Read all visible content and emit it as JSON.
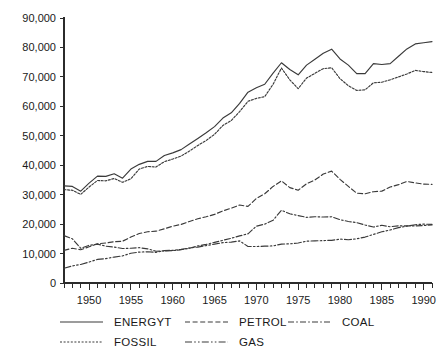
{
  "chart_data": {
    "type": "line",
    "title": "",
    "subtitle": "",
    "xlabel": "",
    "ylabel": "",
    "xlim": [
      1947,
      1991
    ],
    "ylim": [
      0,
      90000
    ],
    "grid": false,
    "legend_position": "bottom",
    "y_ticks": [
      0,
      10000,
      20000,
      30000,
      40000,
      50000,
      60000,
      70000,
      80000,
      90000
    ],
    "y_tick_labels": [
      "0",
      "10,000",
      "20,000",
      "30,000",
      "40,000",
      "50,000",
      "60,000",
      "70,000",
      "80,000",
      "90,000"
    ],
    "x_ticks": [
      1950,
      1955,
      1960,
      1965,
      1970,
      1975,
      1980,
      1985,
      1990
    ],
    "x_tick_labels": [
      "1950",
      "1955",
      "1960",
      "1965",
      "1970",
      "1975",
      "1980",
      "1985",
      "1990"
    ],
    "x_minor_tick_interval": 1,
    "x": [
      1947,
      1948,
      1949,
      1950,
      1951,
      1952,
      1953,
      1954,
      1955,
      1956,
      1957,
      1958,
      1959,
      1960,
      1961,
      1962,
      1963,
      1964,
      1965,
      1966,
      1967,
      1968,
      1969,
      1970,
      1971,
      1972,
      1973,
      1974,
      1975,
      1976,
      1977,
      1978,
      1979,
      1980,
      1981,
      1982,
      1983,
      1984,
      1985,
      1986,
      1987,
      1988,
      1989,
      1990,
      1991
    ],
    "series": [
      {
        "name": "ENERGYT",
        "style": "solid",
        "values": [
          33000,
          32800,
          31200,
          33900,
          36300,
          36200,
          37100,
          35600,
          38700,
          40300,
          41300,
          41300,
          43300,
          44200,
          45300,
          47200,
          49100,
          51000,
          53100,
          56000,
          57800,
          61000,
          64800,
          66300,
          67500,
          71300,
          74800,
          72500,
          70700,
          74000,
          76000,
          78000,
          79400,
          76100,
          74000,
          71100,
          71100,
          74500,
          74200,
          74500,
          77000,
          79500,
          81200,
          81600,
          82000
        ]
      },
      {
        "name": "FOSSIL",
        "style": "dotted",
        "values": [
          31700,
          31500,
          30100,
          32600,
          34800,
          34700,
          35500,
          34200,
          35400,
          38700,
          39600,
          39400,
          41200,
          42100,
          43100,
          44800,
          46700,
          48400,
          50500,
          53500,
          55200,
          58200,
          61700,
          62700,
          63300,
          67500,
          73000,
          69000,
          66000,
          69600,
          71200,
          72800,
          73100,
          69400,
          67000,
          65400,
          65600,
          68000,
          68200,
          69000,
          70000,
          71000,
          72200,
          71800,
          71500
        ]
      },
      {
        "name": "PETROL",
        "style": "dashed",
        "values": [
          11100,
          11800,
          11300,
          12300,
          13300,
          13600,
          14000,
          14200,
          15600,
          16800,
          17400,
          17600,
          18400,
          19300,
          19900,
          20900,
          21800,
          22500,
          23300,
          24500,
          25400,
          26500,
          26000,
          28700,
          30300,
          32800,
          34700,
          32400,
          31500,
          33700,
          35000,
          37000,
          38000,
          35200,
          32800,
          30500,
          30300,
          31000,
          31200,
          32600,
          33400,
          34500,
          34000,
          33600,
          33500
        ]
      },
      {
        "name": "COAL",
        "style": "dash-dot",
        "values": [
          16100,
          15000,
          11800,
          12800,
          13200,
          12500,
          12200,
          11700,
          11800,
          12000,
          11600,
          10800,
          10900,
          11000,
          11300,
          11800,
          12600,
          13100,
          13800,
          14500,
          15200,
          16000,
          16700,
          19300,
          20000,
          21300,
          24700,
          23500,
          22900,
          22300,
          22500,
          22400,
          22500,
          21500,
          20900,
          20500,
          19700,
          19000,
          19600,
          19100,
          19400,
          19400,
          19400,
          19500,
          19700
        ]
      },
      {
        "name": "GAS",
        "style": "dash-dot-dot",
        "values": [
          5000,
          5800,
          6300,
          7100,
          8000,
          8300,
          8800,
          9200,
          10100,
          10500,
          10600,
          10400,
          11000,
          11100,
          11400,
          11900,
          12200,
          12700,
          13200,
          13700,
          13900,
          14300,
          12400,
          12400,
          12500,
          12600,
          13200,
          13300,
          13600,
          14200,
          14300,
          14400,
          14500,
          14900,
          14700,
          15000,
          15600,
          16500,
          17400,
          18000,
          18800,
          19300,
          19800,
          20000,
          19900
        ]
      }
    ],
    "legend": [
      {
        "label": "ENERGYT",
        "style": "solid"
      },
      {
        "label": "PETROL",
        "style": "dashed"
      },
      {
        "label": "COAL",
        "style": "dash-dot"
      },
      {
        "label": "FOSSIL",
        "style": "dotted"
      },
      {
        "label": "GAS",
        "style": "dash-dot-dot"
      }
    ],
    "colors": {
      "line": "#3a3a3a",
      "axis": "#2b2b2b",
      "text": "#1a1a1a",
      "background": "#ffffff"
    }
  }
}
